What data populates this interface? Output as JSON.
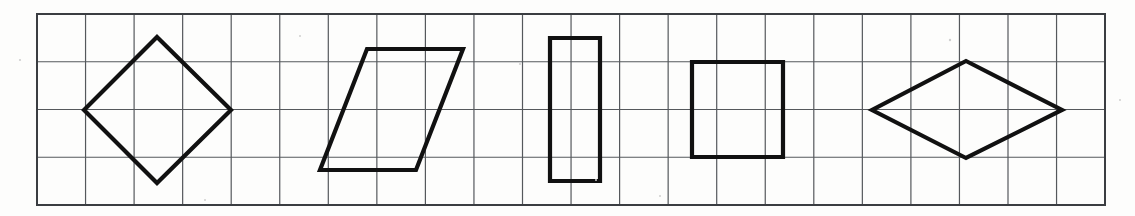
{
  "canvas": {
    "width": 1135,
    "height": 216,
    "background_color": "#fdfdfc",
    "description": "Geometry worksheet strip showing five quadrilaterals drawn on a square grid"
  },
  "grid": {
    "name": "square-grid",
    "x": 37,
    "y": 14,
    "width": 1068,
    "height": 191,
    "columns": 22,
    "rows": 4,
    "cell_width": 48.55,
    "cell_height": 47.75,
    "line_color": "#55585c",
    "line_width": 1.2,
    "border_color": "#3a3d41",
    "border_width": 2
  },
  "shapes": {
    "stroke_color": "#111111",
    "stroke_width": 4.2,
    "items": [
      {
        "id": "shape-1",
        "name": "rotated-square-diamond",
        "label": "Rotated square (diamond)",
        "type": "polygon",
        "points": "157,37 231,110 157,183 84,110"
      },
      {
        "id": "shape-2",
        "name": "parallelogram",
        "label": "Parallelogram",
        "type": "polygon",
        "points": "367,49 463,49 416,170 320,170"
      },
      {
        "id": "shape-3",
        "name": "vertical-rectangle",
        "label": "Vertical rectangle",
        "type": "polygon",
        "points": "550,38 600,38 600,181 550,181"
      },
      {
        "id": "shape-4",
        "name": "square",
        "label": "Square",
        "type": "polygon",
        "points": "692,62 783,62 783,157 692,157"
      },
      {
        "id": "shape-5",
        "name": "rhombus",
        "label": "Rhombus",
        "type": "polygon",
        "points": "966,61 1062,110 966,158 872,110"
      }
    ]
  },
  "speckles": [
    {
      "x": 20,
      "y": 60,
      "r": 1.1
    },
    {
      "x": 300,
      "y": 36,
      "r": 1.0
    },
    {
      "x": 520,
      "y": 64,
      "r": 1.1
    },
    {
      "x": 596,
      "y": 180,
      "r": 1.0
    },
    {
      "x": 950,
      "y": 40,
      "r": 1.2
    },
    {
      "x": 1120,
      "y": 100,
      "r": 1.0
    },
    {
      "x": 660,
      "y": 196,
      "r": 1.0
    },
    {
      "x": 205,
      "y": 200,
      "r": 1.0
    }
  ]
}
